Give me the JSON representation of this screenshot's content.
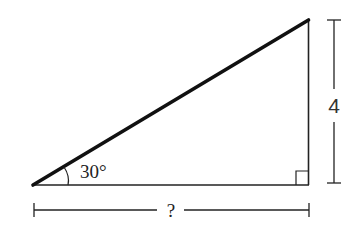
{
  "diagram": {
    "type": "right-triangle",
    "angle_label": "30°",
    "vertical_side_label": "4",
    "horizontal_side_label": "?",
    "colors": {
      "stroke": "#1a1a1a",
      "background": "#ffffff"
    }
  }
}
